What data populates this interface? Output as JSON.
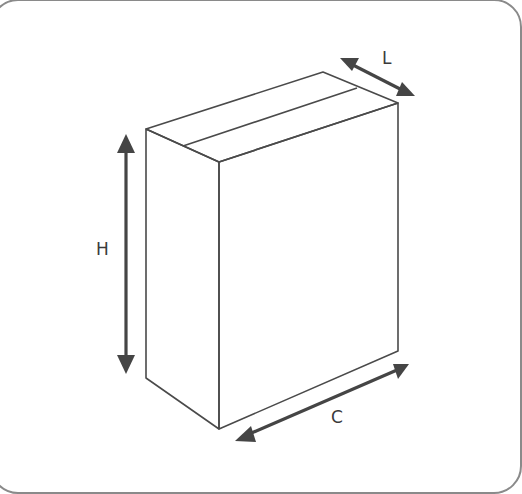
{
  "diagram": {
    "dimensions": [
      {
        "key": "L",
        "label": "L",
        "meaning": "length (depth)"
      },
      {
        "key": "H",
        "label": "H",
        "meaning": "height"
      },
      {
        "key": "C",
        "label": "C",
        "meaning": "width"
      }
    ],
    "colors": {
      "line": "#4a4a4a",
      "arrow": "#454545",
      "frame": "#8a8a8a",
      "background": "#ffffff"
    }
  }
}
